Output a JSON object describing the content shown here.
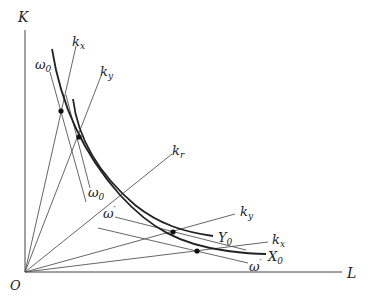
{
  "diagram": {
    "type": "isoquant factor-intensity diagram",
    "axes": {
      "origin_label": "O",
      "y_label": "K",
      "x_label": "L"
    },
    "rays": [
      {
        "id": "kx_upper",
        "label": "k",
        "sub": "x"
      },
      {
        "id": "ky_upper",
        "label": "k",
        "sub": "y"
      },
      {
        "id": "kr",
        "label": "k",
        "sub": "r"
      },
      {
        "id": "ky_lower",
        "label": "k",
        "sub": "y"
      },
      {
        "id": "kx_lower",
        "label": "k",
        "sub": "x"
      }
    ],
    "isoquants": [
      {
        "id": "X0",
        "label": "X",
        "sub": "0"
      },
      {
        "id": "Y0",
        "label": "Y",
        "sub": "0"
      }
    ],
    "wage_rental_lines": [
      {
        "id": "omega0_upper",
        "label": "ω",
        "sub": "0"
      },
      {
        "id": "omega0_lower",
        "label": "ω",
        "sub": "0"
      },
      {
        "id": "omega_prime_mid",
        "label": "ω",
        "sup": "′"
      },
      {
        "id": "omega_prime_low",
        "label": "ω",
        "sup": "′"
      }
    ],
    "colors": {
      "line": "#555555",
      "curve": "#222222",
      "background": "#ffffff"
    }
  }
}
